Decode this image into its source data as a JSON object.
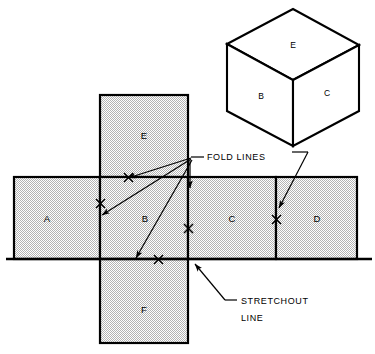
{
  "figure": {
    "colors": {
      "line": "#000000",
      "panel_fill": "#d9d9d9",
      "background": "#ffffff",
      "cube_fill": "#ffffff"
    },
    "annotations": {
      "fold_lines_label": "FOLD  LINES",
      "stretchout_label_line1": "STRETCHOUT",
      "stretchout_label_line2": "LINE"
    },
    "pictorial_cube": {
      "name": "isometric-cube",
      "faces": [
        {
          "id": "E",
          "label": "E",
          "position": "top"
        },
        {
          "id": "B",
          "label": "B",
          "position": "left-front"
        },
        {
          "id": "C",
          "label": "C",
          "position": "right-front"
        }
      ]
    },
    "stretchout": {
      "strip_panels": [
        {
          "id": "A",
          "label": "A"
        },
        {
          "id": "B",
          "label": "B"
        },
        {
          "id": "C",
          "label": "C"
        },
        {
          "id": "D",
          "label": "D"
        }
      ],
      "flap_panels": [
        {
          "id": "E",
          "label": "E",
          "position": "top"
        },
        {
          "id": "F",
          "label": "F",
          "position": "bottom"
        }
      ],
      "fold_line_marks": 5,
      "fold_mark_glyph": "X"
    }
  }
}
